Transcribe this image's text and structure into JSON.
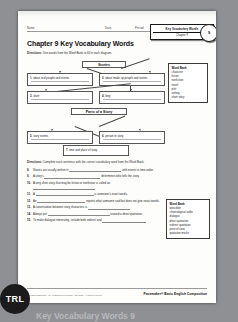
{
  "window": {
    "background_color": "#8f9094",
    "page_color": "#fdfdfb"
  },
  "header": {
    "name_label": "Name",
    "date_label": "Date",
    "period_label": "Period"
  },
  "chapter_tab": {
    "line1": "Key Vocabulary Words",
    "line2": "Chapter 9",
    "circle_number": "9"
  },
  "title": "Chapter 9 Key Vocabulary Words",
  "directions_1": {
    "label": "Directions:",
    "text": "Use words from the Word Bank to fill in each diagram."
  },
  "diagram": {
    "stories_heading": "Stories",
    "parts_heading": "Parts of a Story",
    "boxes": [
      {
        "num": "1.",
        "text": "about real people and events"
      },
      {
        "num": "2.",
        "text": "about made up people and events"
      },
      {
        "num": "3.",
        "text": "short"
      },
      {
        "num": "4.",
        "text": "long"
      },
      {
        "num": "5.",
        "text": "story events"
      },
      {
        "num": "6.",
        "text": "person in story"
      },
      {
        "num": "7.",
        "text": "time and place of story"
      }
    ]
  },
  "word_bank_1": {
    "title": "Word Bank",
    "words": [
      "character",
      "fiction",
      "nonfiction",
      "novel",
      "plot",
      "setting",
      "short story"
    ]
  },
  "directions_2": {
    "label": "Directions:",
    "text": "Complete each sentence with the correct vocabulary word from the Word Bank."
  },
  "questions": [
    {
      "num": "8.",
      "part1": "Stories are usually written in",
      "part2": "with events in time order."
    },
    {
      "num": "9.",
      "part1": "A story's",
      "part2": "determines who tells the story."
    },
    {
      "num": "10.",
      "part1": "A very short story that may be fiction or nonfiction is called an",
      "part2": ""
    },
    {
      "num": "11.",
      "part1": "A",
      "part2": "is someone's exact words."
    },
    {
      "num": "12.",
      "part1": "An",
      "part2": "reports what someone said but does not give exact words."
    },
    {
      "num": "13.",
      "part1": "A conversation between story characters is",
      "part2": ""
    },
    {
      "num": "14.",
      "part1": "Always put",
      "part2": "around a direct quotation."
    },
    {
      "num": "15.",
      "part1": "To make dialogue interesting, include both indirect and",
      "part2": ""
    }
  ],
  "word_bank_2": {
    "title": "Word Bank",
    "words": [
      "anecdote",
      "chronological order",
      "dialogue",
      "direct quotation",
      "indirect quotation",
      "point of view",
      "quotation marks"
    ]
  },
  "footer": {
    "copyright": "© Pearson Education, Inc., publishing as Pearson AGS Globe. All rights reserved.",
    "brand": "Pacemaker® Basic English Composition"
  },
  "badge": {
    "label": "TRL"
  },
  "caption": "Key Vocabulary Words 9"
}
